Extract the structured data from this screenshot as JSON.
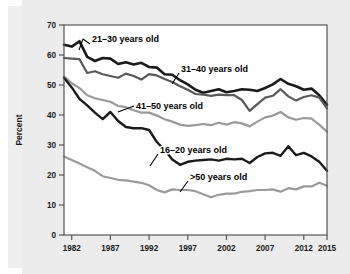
{
  "figure": {
    "background_color": "#ececec",
    "plot_background_color": "#ffffff",
    "frame_color": "#555555"
  },
  "chart_data": {
    "type": "line",
    "title": "",
    "xlabel": "",
    "ylabel": "Percent",
    "xlim": [
      1981,
      2015
    ],
    "ylim": [
      0,
      70
    ],
    "ytick_values": [
      0,
      10,
      20,
      30,
      40,
      50,
      60,
      70
    ],
    "ytick_labels": [
      "0",
      "10",
      "20",
      "30",
      "40",
      "50",
      "60",
      "70"
    ],
    "xtick_values": [
      1982,
      1987,
      1992,
      1997,
      2002,
      2007,
      2012,
      2015
    ],
    "xtick_labels": [
      "1982",
      "1987",
      "1992",
      "1997",
      "2002",
      "2007",
      "2012",
      "2015"
    ],
    "grid": false,
    "legend_position": "inline-annotations",
    "x": [
      1981,
      1982,
      1983,
      1984,
      1985,
      1986,
      1987,
      1988,
      1989,
      1990,
      1991,
      1992,
      1993,
      1994,
      1995,
      1996,
      1997,
      1998,
      1999,
      2000,
      2001,
      2002,
      2003,
      2004,
      2005,
      2006,
      2007,
      2008,
      2009,
      2010,
      2011,
      2012,
      2013,
      2014,
      2015
    ],
    "series": [
      {
        "name": "21-30 years old",
        "label": "21–30 years old",
        "color": "#1a1a1a",
        "linewidth": 2.6,
        "values": [
          63.4,
          62.8,
          64.6,
          59.4,
          58.0,
          59.0,
          58.8,
          57.0,
          57.6,
          56.8,
          57.4,
          56.0,
          55.8,
          53.6,
          53.4,
          51.6,
          50.2,
          48.4,
          47.4,
          48.0,
          48.6,
          47.6,
          48.0,
          48.6,
          48.4,
          48.0,
          49.0,
          50.2,
          52.0,
          50.4,
          49.6,
          48.4,
          48.8,
          46.6,
          43.4
        ]
      },
      {
        "name": "31-40 years old",
        "label": "31–40 years old",
        "color": "#5a5a5a",
        "linewidth": 2.2,
        "values": [
          59.0,
          58.8,
          58.6,
          54.0,
          54.6,
          53.6,
          53.0,
          52.4,
          53.8,
          53.0,
          51.8,
          53.6,
          53.2,
          52.0,
          51.0,
          49.6,
          48.4,
          47.0,
          46.8,
          46.4,
          46.8,
          46.6,
          46.6,
          45.0,
          41.4,
          43.6,
          45.8,
          46.4,
          48.6,
          46.2,
          44.8,
          46.0,
          46.6,
          45.8,
          42.2
        ]
      },
      {
        "name": "41-50 years old",
        "label": "41–50 years old",
        "color": "#9a9a9a",
        "linewidth": 2.2,
        "values": [
          52.8,
          50.6,
          49.0,
          46.6,
          45.6,
          45.0,
          44.4,
          43.0,
          42.6,
          41.6,
          40.8,
          40.8,
          39.8,
          38.6,
          37.8,
          36.8,
          36.4,
          36.6,
          37.0,
          36.6,
          37.4,
          36.8,
          37.6,
          37.2,
          36.2,
          37.8,
          39.2,
          39.8,
          41.0,
          39.2,
          38.4,
          39.0,
          38.8,
          36.8,
          34.4
        ]
      },
      {
        "name": "16-20 years old",
        "label": "16–20 years old",
        "color": "#1a1a1a",
        "linewidth": 2.4,
        "values": [
          52.4,
          49.2,
          45.4,
          43.2,
          40.8,
          38.6,
          41.0,
          38.0,
          36.0,
          35.6,
          35.6,
          35.0,
          31.0,
          28.4,
          25.2,
          23.4,
          24.4,
          24.8,
          25.0,
          25.2,
          24.8,
          25.4,
          25.2,
          25.4,
          24.0,
          26.0,
          27.2,
          27.4,
          26.4,
          29.6,
          26.6,
          27.4,
          26.2,
          24.4,
          21.4
        ]
      },
      {
        "name": ">50 years old",
        "label": ">50 years old",
        "color": "#9a9a9a",
        "linewidth": 2.2,
        "values": [
          26.2,
          25.0,
          23.8,
          22.6,
          21.4,
          19.6,
          19.0,
          18.4,
          18.2,
          17.8,
          17.4,
          16.6,
          15.0,
          14.2,
          15.2,
          15.0,
          15.0,
          14.6,
          13.6,
          12.6,
          13.4,
          13.8,
          13.8,
          14.4,
          14.6,
          15.0,
          15.0,
          15.2,
          14.4,
          15.6,
          15.2,
          16.2,
          16.2,
          17.4,
          16.4
        ]
      }
    ],
    "annotations": [
      {
        "text": "21–30 years old",
        "label_x": 92,
        "label_y": 42,
        "leader": [
          [
            90,
            44
          ],
          [
            83,
            39
          ],
          [
            79,
            50
          ]
        ]
      },
      {
        "text": "31–40 years old",
        "label_x": 181,
        "label_y": 72,
        "leader": [
          [
            179,
            73
          ],
          [
            172,
            84
          ]
        ]
      },
      {
        "text": "41–50 years old",
        "label_x": 136,
        "label_y": 109,
        "leader": [
          [
            134,
            106
          ],
          [
            118,
            112
          ]
        ]
      },
      {
        "text": "16–20 years old",
        "label_x": 160,
        "label_y": 153,
        "leader": [
          [
            158,
            154
          ],
          [
            150,
            166
          ]
        ]
      },
      {
        "text": ">50 years old",
        "label_x": 190,
        "label_y": 180,
        "leader": [
          [
            188,
            181
          ],
          [
            180,
            192
          ]
        ]
      }
    ]
  }
}
